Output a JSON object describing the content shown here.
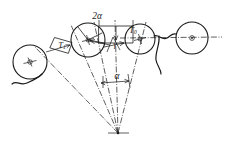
{
  "figure": {
    "background_color": "#ffffff",
    "line_color": "#1a1a1a",
    "labels": {
      "wrap_angle_double": "2α",
      "tension_loaded": "T",
      "tension_loaded_sub": "1",
      "tension_slack": "T",
      "tension_slack_sub": "0",
      "gamma": "γ",
      "alpha": "α"
    },
    "icons": {
      "apex_marker": "convergence-point-marker",
      "center_marker": "sheave-center-mark",
      "arrow": "dimension-arrow"
    },
    "elements": [
      {
        "name": "sheave-left",
        "type": "circle",
        "cx": 30,
        "cy": 62,
        "r": 17
      },
      {
        "name": "sheave-middle",
        "type": "circle",
        "cx": 88,
        "cy": 40,
        "r": 17
      },
      {
        "name": "sheave-right",
        "type": "circle",
        "cx": 140,
        "cy": 39,
        "r": 15
      },
      {
        "name": "sheave-far-right",
        "type": "circle",
        "cx": 192,
        "cy": 38,
        "r": 16
      },
      {
        "name": "apex",
        "type": "point",
        "cx": 118,
        "cy": 133
      }
    ]
  }
}
